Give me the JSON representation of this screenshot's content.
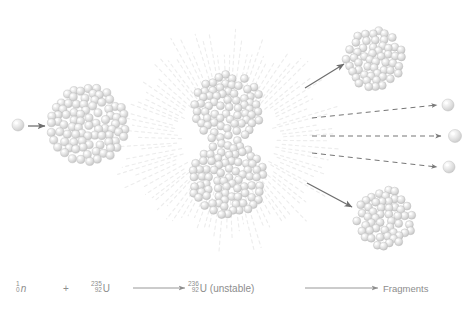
{
  "figure": {
    "background_color": "#ffffff",
    "sphere_color": "#d8d8d8",
    "sphere_highlight_color": "#f4f4f4",
    "outline_color": "#bdbdbd",
    "arrow_color": "#6e6e6e",
    "ray_color": "#ededed",
    "text_color": "#8d8d8d"
  },
  "stages": {
    "incoming_neutron": {
      "label": "incoming-neutron",
      "cx": 18,
      "cy": 125,
      "r": 6
    },
    "target_nucleus": {
      "label": "uranium-235-nucleus",
      "cx": 88,
      "cy": 125,
      "r": 41,
      "nucleon_count": 96
    },
    "compound_nucleus": {
      "label": "uranium-236-deforming-nucleus",
      "cx": 228,
      "cy": 140,
      "top_cx": 228,
      "top_cy": 108,
      "top_r": 37,
      "bottom_cx": 228,
      "bottom_cy": 180,
      "bottom_r": 40,
      "nucleon_count": 150
    },
    "fragment_top": {
      "label": "fission-fragment-top",
      "cx": 374,
      "cy": 59,
      "r": 32,
      "nucleon_count": 62
    },
    "fragment_bottom": {
      "label": "fission-fragment-bottom",
      "cx": 385,
      "cy": 218,
      "r": 32,
      "nucleon_count": 62
    },
    "released_neutrons": [
      {
        "label": "released-neutron-1",
        "cx": 448,
        "cy": 105,
        "r": 6
      },
      {
        "label": "released-neutron-2",
        "cx": 455,
        "cy": 136,
        "r": 6.5
      },
      {
        "label": "released-neutron-3",
        "cx": 449,
        "cy": 167,
        "r": 6
      }
    ]
  },
  "arrows": {
    "incoming": {
      "x1": 28,
      "y1": 126,
      "x2": 45,
      "y2": 126,
      "style": "solid"
    },
    "fragment_top": {
      "x1": 305,
      "y1": 88,
      "x2": 344,
      "y2": 64,
      "style": "solid"
    },
    "fragment_bottom": {
      "x1": 307,
      "y1": 183,
      "x2": 352,
      "y2": 207,
      "style": "solid"
    },
    "neutron_1": {
      "x1": 312,
      "y1": 118,
      "x2": 437,
      "y2": 105,
      "style": "dashed"
    },
    "neutron_2": {
      "x1": 312,
      "y1": 136,
      "x2": 441,
      "y2": 136,
      "style": "dashed"
    },
    "neutron_3": {
      "x1": 312,
      "y1": 153,
      "x2": 437,
      "y2": 167,
      "style": "dashed"
    }
  },
  "radiation": {
    "label": "energy-release-rays",
    "cx": 228,
    "cy": 140,
    "inner_radius": 46,
    "outer_radius": 118,
    "ray_count": 96
  },
  "equation": {
    "reactant_neutron": {
      "mass_number": "1",
      "atomic_number": "0",
      "symbol": "n"
    },
    "plus": "+",
    "reactant_uranium": {
      "mass_number": "235",
      "atomic_number": "92",
      "symbol": "U"
    },
    "arrow_1": "→",
    "intermediate": {
      "mass_number": "236",
      "atomic_number": "92",
      "symbol": "U (unstable)"
    },
    "arrow_2": "→",
    "products": "Fragments"
  }
}
